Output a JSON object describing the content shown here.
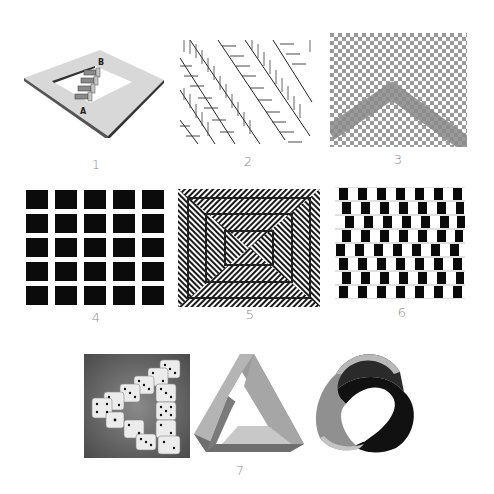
{
  "figure": {
    "panels": [
      {
        "id": 1,
        "label": "1",
        "name": "penrose-stairs",
        "annotations": [
          "A",
          "B"
        ]
      },
      {
        "id": 2,
        "label": "2",
        "name": "zollner-illusion"
      },
      {
        "id": 3,
        "label": "3",
        "name": "checkerboard-bend-illusion"
      },
      {
        "id": 4,
        "label": "4",
        "name": "hermann-grid",
        "rows": 5,
        "cols": 5
      },
      {
        "id": 5,
        "label": "5",
        "name": "zigzag-concentric-squares"
      },
      {
        "id": 6,
        "label": "6",
        "name": "cafe-wall-illusion",
        "rows": 8
      },
      {
        "id": 7,
        "label": "7",
        "name": "impossible-objects",
        "items": [
          "impossible-dice-triangle",
          "penrose-triangle",
          "mobius-strip"
        ]
      }
    ]
  },
  "colors": {
    "background": "#ffffff",
    "label": "#8a8a8a",
    "dark": "#111111",
    "grey": "#888888",
    "light_grey": "#d6d6d6"
  }
}
